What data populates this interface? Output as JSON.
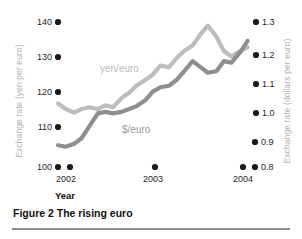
{
  "figure": {
    "caption": "Figure 2 The rising euro",
    "xlabel": "Year"
  },
  "axes": {
    "left_title": "Exchange rate (yen per euro)",
    "right_title": "Exchange rate (dollars per euro)",
    "left_ticks": [
      "140",
      "130",
      "120",
      "110",
      "100"
    ],
    "right_ticks": [
      "1.3",
      "1.2",
      "1.1",
      "1.0",
      "0.9",
      "0.8"
    ],
    "x_ticks": [
      "2002",
      "2003",
      "2004"
    ]
  },
  "series_labels": {
    "yen": "yen/euro",
    "dollar": "$/euro"
  },
  "colors": {
    "yen_line": "#bdbdbd",
    "dollar_line": "#8f8f8f",
    "tick_dot": "#1a1a1a",
    "axis_title": "#b4b4b4",
    "rule": "#8d8d8d"
  },
  "chart_data": {
    "type": "line",
    "title": "Figure 2 The rising euro",
    "xlabel": "Year",
    "ylabel": "Exchange rate (yen per euro)",
    "ylabel_right": "Exchange rate (dollars per euro)",
    "grid": false,
    "legend": "inline-annotations",
    "xlim": [
      2002.0,
      2004.0
    ],
    "x_tick_values": [
      2002,
      2003,
      2004
    ],
    "ylim_left": [
      100,
      140
    ],
    "y_tick_values_left": [
      100,
      110,
      120,
      130,
      140
    ],
    "ylim_right": [
      0.8,
      1.3
    ],
    "y_tick_values_right": [
      0.8,
      0.9,
      1.0,
      1.1,
      1.2,
      1.3
    ],
    "series": [
      {
        "name": "yen/euro",
        "axis": "left",
        "units": "yen per euro",
        "color": "#bdbdbd",
        "x": [
          2002.0,
          2002.08,
          2002.17,
          2002.25,
          2002.33,
          2002.42,
          2002.5,
          2002.58,
          2002.67,
          2002.75,
          2002.83,
          2002.92,
          2003.0,
          2003.08,
          2003.17,
          2003.25,
          2003.33,
          2003.42,
          2003.5,
          2003.58,
          2003.67,
          2003.75,
          2003.83,
          2003.92,
          2004.0
        ],
        "values": [
          117.5,
          116.0,
          115.0,
          116.0,
          116.5,
          116.0,
          117.0,
          116.5,
          119.0,
          120.5,
          122.5,
          124.0,
          125.5,
          128.0,
          127.5,
          130.0,
          132.0,
          133.5,
          136.5,
          139.0,
          136.0,
          132.0,
          130.5,
          132.0,
          133.0
        ]
      },
      {
        "name": "$/euro",
        "axis": "right",
        "units": "dollars per euro",
        "color": "#8f8f8f",
        "x": [
          2002.0,
          2002.08,
          2002.17,
          2002.25,
          2002.33,
          2002.42,
          2002.5,
          2002.58,
          2002.67,
          2002.75,
          2002.83,
          2002.92,
          2003.0,
          2003.08,
          2003.17,
          2003.25,
          2003.33,
          2003.42,
          2003.5,
          2003.58,
          2003.67,
          2003.75,
          2003.83,
          2003.92,
          2004.0
        ],
        "values": [
          0.875,
          0.87,
          0.88,
          0.9,
          0.94,
          0.985,
          0.99,
          0.985,
          0.99,
          1.0,
          1.01,
          1.03,
          1.06,
          1.075,
          1.08,
          1.1,
          1.13,
          1.165,
          1.145,
          1.125,
          1.13,
          1.165,
          1.16,
          1.195,
          1.235
        ]
      }
    ],
    "annotations": [
      {
        "text": "yen/euro",
        "x": 2002.55,
        "y_left": 131.0
      },
      {
        "text": "$/euro",
        "x": 2002.8,
        "y_right": 1.02
      }
    ]
  }
}
